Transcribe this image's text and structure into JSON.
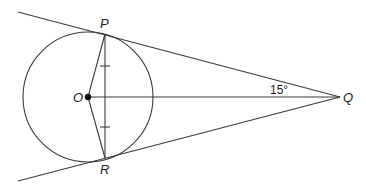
{
  "figure": {
    "type": "geometry",
    "points": {
      "O": {
        "label": "O",
        "x": 88,
        "y": 97
      },
      "P": {
        "label": "P",
        "x": 105,
        "y": 34
      },
      "R": {
        "label": "R",
        "x": 105,
        "y": 158
      },
      "Q": {
        "label": "Q",
        "x": 340,
        "y": 97
      }
    },
    "circle": {
      "center": "O",
      "radius": 65
    },
    "angle_label": "15°",
    "line_color": "#3a3a3a"
  }
}
